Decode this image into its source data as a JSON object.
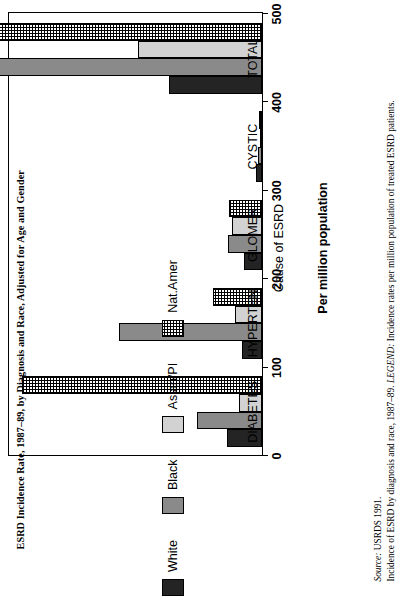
{
  "title": "ESRD Incidence Rate, 1987–89, by Diagnosis and Race, Adjusted for Age and Gender",
  "caption": {
    "source_label": "Source:",
    "source_text": " USRDS 1991.",
    "body_pre": "Incidence of ESRD by diagnosis and race, 1987–89. ",
    "body_legend_label": "LEGEND:",
    "body_post": " Incidence rates per million population of treated ESRD patients."
  },
  "chart_data": {
    "type": "bar",
    "orientation": "vertical",
    "title": "ESRD Incidence Rate, 1987–89, by Diagnosis and Race, Adjusted for Age and Gender",
    "xlabel": "Cause of ESRD",
    "ylabel": "Per million population",
    "ylim": [
      0,
      500
    ],
    "yticks": [
      0,
      100,
      200,
      300,
      400,
      500
    ],
    "ytick_labels": [
      "0",
      "100",
      "200",
      "300",
      "400",
      "500"
    ],
    "grid": false,
    "legend_position": "bottom",
    "categories": [
      "DIABETES",
      "HYPERTEN",
      "GLOMER",
      "CYSTIC",
      "TOTAL"
    ],
    "series": [
      {
        "name": "White",
        "color": "#242424",
        "pattern": "solid-dark",
        "values": [
          40,
          23,
          20,
          7,
          105
        ]
      },
      {
        "name": "Black",
        "color": "#8a8a8a",
        "pattern": "solid-mid",
        "values": [
          73,
          162,
          38,
          4,
          432
        ]
      },
      {
        "name": "Asian/PI",
        "color": "#d2d2d2",
        "pattern": "solid-light",
        "values": [
          26,
          30,
          34,
          2,
          140
        ]
      },
      {
        "name": "Nat.Amer",
        "color": "#ffffff",
        "pattern": "crosshatch",
        "values": [
          272,
          55,
          37,
          3,
          419
        ]
      }
    ]
  }
}
